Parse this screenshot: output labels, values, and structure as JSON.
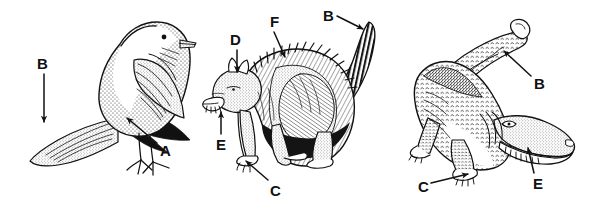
{
  "figure": {
    "background_color": "#ffffff",
    "ink_color": "#111111",
    "width": 589,
    "height": 205
  },
  "panels": [
    {
      "id": "bird",
      "name": "bird-figure",
      "subject": "bird",
      "labels": [
        {
          "key": "bird-label-B",
          "text": "B",
          "x": 37,
          "y": 56,
          "arrow": {
            "x1": 44,
            "y1": 74,
            "x2": 44,
            "y2": 122,
            "head": "down"
          }
        },
        {
          "key": "bird-label-A",
          "text": "A",
          "x": 160,
          "y": 143,
          "arrow": {
            "x1": 157,
            "y1": 143,
            "x2": 127,
            "y2": 118,
            "head": "up-left"
          }
        }
      ]
    },
    {
      "id": "cat",
      "name": "cat-figure",
      "subject": "cat",
      "labels": [
        {
          "key": "cat-label-D",
          "text": "D",
          "x": 230,
          "y": 32,
          "arrow": {
            "x1": 237,
            "y1": 50,
            "x2": 237,
            "y2": 72,
            "head": "down"
          }
        },
        {
          "key": "cat-label-F",
          "text": "F",
          "x": 270,
          "y": 14,
          "arrow": {
            "x1": 274,
            "y1": 32,
            "x2": 285,
            "y2": 57,
            "head": "down-right"
          }
        },
        {
          "key": "cat-label-B",
          "text": "B",
          "x": 323,
          "y": 8,
          "arrow": {
            "x1": 337,
            "y1": 16,
            "x2": 363,
            "y2": 29,
            "head": "right-down"
          }
        },
        {
          "key": "cat-label-E",
          "text": "E",
          "x": 216,
          "y": 137,
          "arrow": {
            "x1": 221,
            "y1": 134,
            "x2": 221,
            "y2": 112,
            "head": "up"
          }
        },
        {
          "key": "cat-label-C",
          "text": "C",
          "x": 270,
          "y": 183,
          "arrow": {
            "x1": 268,
            "y1": 180,
            "x2": 246,
            "y2": 161,
            "head": "up-left"
          }
        }
      ]
    },
    {
      "id": "crocodile",
      "name": "crocodile-figure",
      "subject": "crocodile",
      "labels": [
        {
          "key": "croc-label-B",
          "text": "B",
          "x": 534,
          "y": 76,
          "arrow": {
            "x1": 531,
            "y1": 76,
            "x2": 504,
            "y2": 51,
            "head": "up-left"
          }
        },
        {
          "key": "croc-label-C",
          "text": "C",
          "x": 418,
          "y": 179,
          "arrow": {
            "x1": 431,
            "y1": 183,
            "x2": 468,
            "y2": 174,
            "head": "right"
          }
        },
        {
          "key": "croc-label-E",
          "text": "E",
          "x": 533,
          "y": 176,
          "arrow": {
            "x1": 534,
            "y1": 173,
            "x2": 528,
            "y2": 148,
            "head": "up"
          }
        }
      ]
    }
  ],
  "legend_keys": [
    "A",
    "B",
    "C",
    "D",
    "E",
    "F"
  ]
}
